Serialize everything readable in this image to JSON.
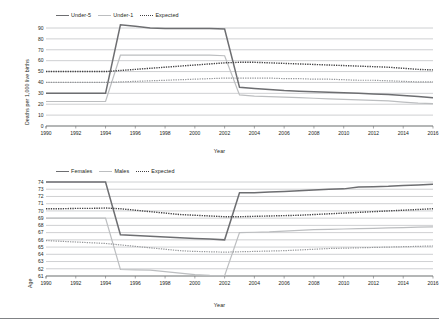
{
  "figures": [
    {
      "id": "child-mortality",
      "legend": [
        {
          "label": "Under-5",
          "style": "solid-dark"
        },
        {
          "label": "Under-1",
          "style": "solid-light"
        },
        {
          "label": "Expected",
          "style": "dotted"
        }
      ],
      "ylabel": "Deaths per 1,000 live births",
      "xlabel": "Year",
      "chart_data": {
        "type": "line",
        "title": "",
        "xlabel": "Year",
        "ylabel": "Deaths per 1,000 live births",
        "xlim": [
          1990,
          2016
        ],
        "ylim": [
          0,
          90
        ],
        "yticks": [
          0,
          10,
          20,
          30,
          40,
          50,
          60,
          70,
          80,
          90
        ],
        "xticks": [
          1990,
          1992,
          1994,
          1996,
          1998,
          2000,
          2002,
          2004,
          2006,
          2008,
          2010,
          2012,
          2014,
          2016
        ],
        "grid": true,
        "legend_position": "top-left",
        "x": [
          1990,
          1991,
          1992,
          1993,
          1994,
          1995,
          1996,
          1997,
          1998,
          1999,
          2000,
          2001,
          2002,
          2003,
          2004,
          2005,
          2006,
          2007,
          2008,
          2009,
          2010,
          2011,
          2012,
          2013,
          2014,
          2015,
          2016
        ],
        "series": [
          {
            "name": "Under-5",
            "style": "solid-dark",
            "values": [
              30,
              30,
              30,
              30,
              30,
              93,
              91.5,
              90,
              89.5,
              89.5,
              89.5,
              89.5,
              89,
              35.5,
              34.5,
              33.5,
              32.5,
              32,
              31.5,
              31,
              30.5,
              30,
              29.5,
              29,
              28,
              27,
              26
            ]
          },
          {
            "name": "Under-1",
            "style": "solid-light",
            "values": [
              22.5,
              22.5,
              22.5,
              22.5,
              22.5,
              65,
              65,
              65,
              65,
              65,
              65,
              65,
              64.5,
              28.5,
              27.5,
              27,
              26.5,
              26,
              25.5,
              25,
              24.5,
              24,
              23.5,
              23,
              22,
              21,
              20.5
            ]
          },
          {
            "name": "Expected (under-5)",
            "style": "dotted-dark",
            "values": [
              50,
              50,
              50,
              50,
              50,
              51,
              52,
              53,
              54,
              55,
              56,
              57,
              58,
              58.5,
              58.5,
              58,
              57.5,
              57,
              56.5,
              56,
              55.5,
              55,
              54.5,
              54,
              53,
              52,
              51.5
            ]
          },
          {
            "name": "Expected (under-1)",
            "style": "dotted-light",
            "values": [
              40,
              40,
              40,
              40,
              40,
              40.5,
              41,
              41.5,
              42,
              42.5,
              43,
              43.5,
              44,
              44,
              44,
              44,
              43.5,
              43.5,
              43,
              43,
              42.5,
              42,
              42,
              41.5,
              41,
              40.5,
              40.5
            ]
          }
        ]
      }
    },
    {
      "id": "life-expectancy",
      "legend": [
        {
          "label": "Females",
          "style": "solid-dark"
        },
        {
          "label": "Males",
          "style": "solid-light"
        },
        {
          "label": "Expected",
          "style": "dotted"
        }
      ],
      "ylabel": "Age",
      "xlabel": "Year",
      "chart_data": {
        "type": "line",
        "title": "",
        "xlabel": "Year",
        "ylabel": "Age",
        "xlim": [
          1990,
          2016
        ],
        "ylim": [
          61,
          74
        ],
        "yticks": [
          61,
          62,
          63,
          64,
          65,
          66,
          67,
          68,
          69,
          70,
          71,
          72,
          73,
          74
        ],
        "xticks": [
          1990,
          1992,
          1994,
          1996,
          1998,
          2000,
          2002,
          2004,
          2006,
          2008,
          2010,
          2012,
          2014,
          2016
        ],
        "grid": true,
        "legend_position": "top-left",
        "x": [
          1990,
          1991,
          1992,
          1993,
          1994,
          1995,
          1996,
          1997,
          1998,
          1999,
          2000,
          2001,
          2002,
          2003,
          2004,
          2005,
          2006,
          2007,
          2008,
          2009,
          2010,
          2011,
          2012,
          2013,
          2014,
          2015,
          2016
        ],
        "series": [
          {
            "name": "Females",
            "style": "solid-dark",
            "values": [
              74,
              74,
              74,
              74,
              74,
              66.7,
              66.6,
              66.5,
              66.4,
              66.3,
              66.2,
              66.1,
              66,
              72.5,
              72.5,
              72.6,
              72.7,
              72.8,
              72.9,
              73,
              73.05,
              73.3,
              73.35,
              73.4,
              73.5,
              73.6,
              73.7
            ]
          },
          {
            "name": "Males",
            "style": "solid-light",
            "values": [
              69,
              69,
              69,
              69,
              69,
              61.9,
              61.85,
              61.8,
              61.6,
              61.4,
              61.2,
              61.1,
              61.05,
              67,
              67.05,
              67.1,
              67.2,
              67.3,
              67.4,
              67.45,
              67.5,
              67.55,
              67.6,
              67.65,
              67.7,
              67.75,
              67.8
            ]
          },
          {
            "name": "Expected (females)",
            "style": "dotted-dark",
            "values": [
              70.3,
              70.3,
              70.35,
              70.35,
              70.4,
              70.3,
              70.1,
              69.9,
              69.7,
              69.5,
              69.4,
              69.3,
              69.2,
              69.2,
              69.25,
              69.3,
              69.35,
              69.4,
              69.5,
              69.6,
              69.7,
              69.8,
              69.9,
              70,
              70.1,
              70.2,
              70.3
            ]
          },
          {
            "name": "Expected (males)",
            "style": "dotted-light",
            "values": [
              65.9,
              65.8,
              65.7,
              65.6,
              65.5,
              65.3,
              65.1,
              64.9,
              64.7,
              64.5,
              64.4,
              64.35,
              64.3,
              64.35,
              64.4,
              64.45,
              64.5,
              64.6,
              64.7,
              64.8,
              64.85,
              64.9,
              64.95,
              65,
              65.05,
              65.1,
              65.15
            ]
          }
        ]
      }
    }
  ]
}
